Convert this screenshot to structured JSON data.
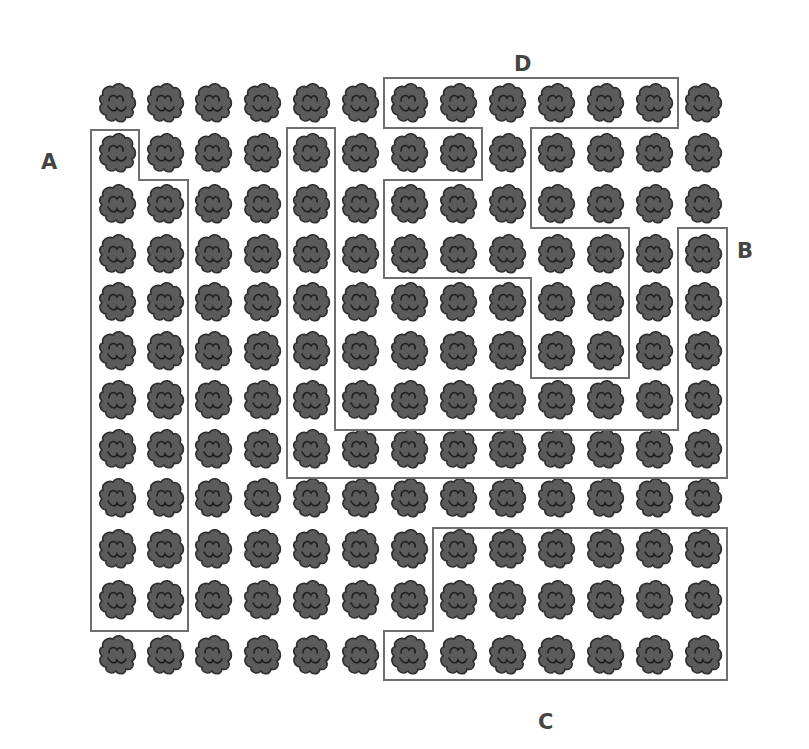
{
  "figure": {
    "width": 809,
    "height": 749,
    "background": "#ffffff"
  },
  "grid": {
    "columns": 13,
    "rows": 12,
    "col_centers": [
      117,
      165,
      213,
      262,
      311,
      360,
      409,
      458,
      507,
      556,
      605,
      654,
      703
    ],
    "row_centers": [
      103,
      153,
      204,
      254,
      302,
      351,
      400,
      449,
      498,
      549,
      600,
      655
    ],
    "item_icon": "cell-cluster-icon",
    "item_fill": "#5a5a5a",
    "item_stroke": "#2a2a2a"
  },
  "outline_color": "#6e6e6e",
  "regions": [
    {
      "id": "A",
      "label": "A",
      "label_pos": [
        49,
        163
      ],
      "points": [
        [
          91,
          130
        ],
        [
          139,
          130
        ],
        [
          139,
          180
        ],
        [
          188,
          180
        ],
        [
          188,
          631
        ],
        [
          91,
          631
        ]
      ]
    },
    {
      "id": "B",
      "label": "B",
      "label_pos": [
        745,
        252
      ],
      "points": [
        [
          287,
          128
        ],
        [
          335,
          128
        ],
        [
          335,
          430
        ],
        [
          678,
          430
        ],
        [
          678,
          228
        ],
        [
          727,
          228
        ],
        [
          727,
          478
        ],
        [
          287,
          478
        ]
      ]
    },
    {
      "id": "C",
      "label": "C",
      "label_pos": [
        546,
        723
      ],
      "points": [
        [
          433,
          528
        ],
        [
          727,
          528
        ],
        [
          727,
          680
        ],
        [
          384,
          680
        ],
        [
          384,
          631
        ],
        [
          433,
          631
        ]
      ]
    },
    {
      "id": "D",
      "label": "D",
      "label_pos": [
        522,
        65
      ],
      "points": [
        [
          384,
          78
        ],
        [
          678,
          78
        ],
        [
          678,
          128
        ],
        [
          531,
          128
        ],
        [
          531,
          228
        ],
        [
          629,
          228
        ],
        [
          629,
          378
        ],
        [
          531,
          378
        ],
        [
          531,
          278
        ],
        [
          384,
          278
        ],
        [
          384,
          180
        ],
        [
          482,
          180
        ],
        [
          482,
          128
        ],
        [
          384,
          128
        ]
      ]
    }
  ]
}
